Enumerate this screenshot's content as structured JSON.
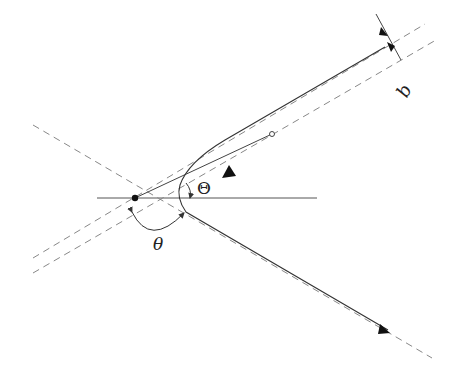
{
  "figure": {
    "top_fragment": "",
    "labels": {
      "impact_parameter": "b",
      "half_angle": "Θ",
      "scattering_angle": "θ"
    },
    "colors": {
      "line": "#333333",
      "dashed": "#777777",
      "background": "#ffffff"
    }
  }
}
